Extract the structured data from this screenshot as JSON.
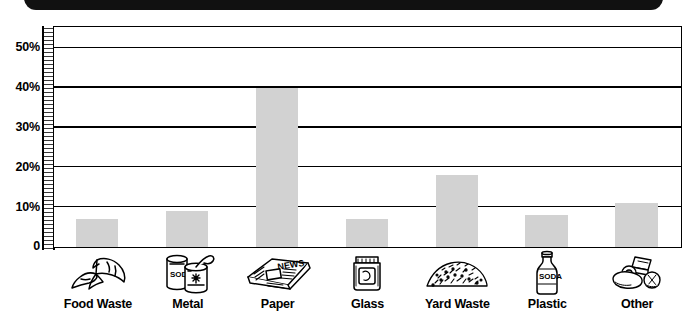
{
  "header": {
    "band_color": "#111111"
  },
  "chart_data": {
    "type": "bar",
    "title": "",
    "subtitle": "",
    "xlabel": "",
    "ylabel": "",
    "categories": [
      "Food Waste",
      "Metal",
      "Paper",
      "Glass",
      "Yard Waste",
      "Plastic",
      "Other"
    ],
    "values": [
      7,
      9,
      40,
      7,
      18,
      8,
      11
    ],
    "value_unit": "%",
    "ylim": [
      0,
      55
    ],
    "y_ticks": [
      0,
      10,
      20,
      30,
      40,
      50
    ],
    "y_tick_labels": [
      "0",
      "10%",
      "20%",
      "30%",
      "40%",
      "50%"
    ],
    "gridlines": [
      10,
      20,
      30,
      40,
      50
    ],
    "grid": true,
    "legend": "none",
    "minor_ticks": true,
    "bar_color": "#d2d2d2",
    "axis_color": "#000000",
    "category_icons": [
      "banana-peel-icon",
      "soda-cans-icon",
      "newspaper-icon",
      "glass-jar-icon",
      "grass-clippings-icon",
      "plastic-bottle-icon",
      "mixed-trash-icon"
    ],
    "icon_texts": {
      "metal": "SODA",
      "paper": "NEWS",
      "plastic": "SODA"
    }
  },
  "y_axis": {
    "labels": [
      "50%",
      "40%",
      "30%",
      "20%",
      "10%",
      "0"
    ]
  }
}
